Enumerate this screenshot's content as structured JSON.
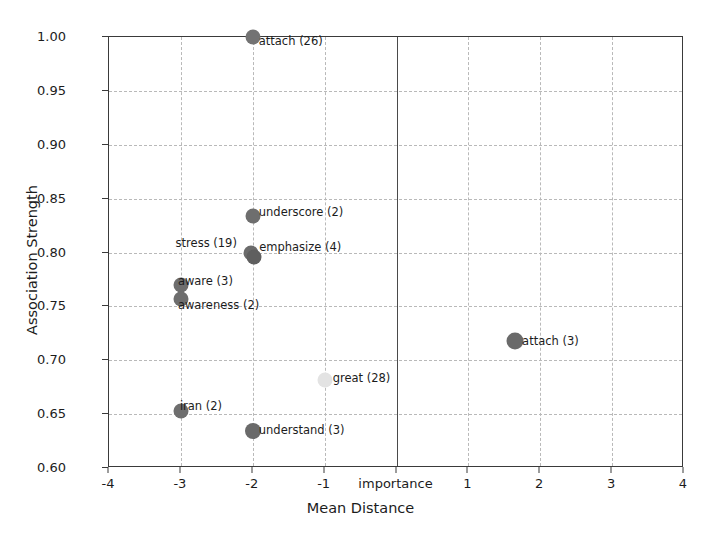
{
  "chart_data": {
    "type": "scatter",
    "title": "",
    "xlabel": "Mean Distance",
    "ylabel": "Association Strength",
    "xlim": [
      -4,
      4
    ],
    "ylim": [
      0.6,
      1.0
    ],
    "grid": true,
    "legend": "none",
    "xticks": [
      -4,
      -3,
      -2,
      -1,
      0,
      1,
      2,
      3,
      4
    ],
    "xtick_labels": [
      "-4",
      "-3",
      "-2",
      "-1",
      "importance",
      "1",
      "2",
      "3",
      "4"
    ],
    "yticks": [
      0.6,
      0.65,
      0.7,
      0.75,
      0.8,
      0.85,
      0.9,
      0.95,
      1.0
    ],
    "ytick_labels": [
      "0.60",
      "0.65",
      "0.70",
      "0.75",
      "0.80",
      "0.85",
      "0.90",
      "0.95",
      "1.00"
    ],
    "vline_x": 0,
    "points": [
      {
        "label": "attach (26)",
        "word": "attach",
        "count": 26,
        "x": -2.0,
        "y": 1.0,
        "size": 15,
        "color": "#737373"
      },
      {
        "label": "underscore (2)",
        "word": "underscore",
        "count": 2,
        "x": -2.0,
        "y": 0.834,
        "size": 15,
        "color": "#6e6e6e"
      },
      {
        "label": "stress (19)",
        "word": "stress",
        "count": 19,
        "x": -2.03,
        "y": 0.8,
        "size": 15,
        "color": "#6b6b6b"
      },
      {
        "label": "emphasize (4)",
        "word": "emphasize",
        "count": 4,
        "x": -1.98,
        "y": 0.796,
        "size": 15,
        "color": "#5f5f5f"
      },
      {
        "label": "aware (3)",
        "word": "aware",
        "count": 3,
        "x": -3.0,
        "y": 0.77,
        "size": 15,
        "color": "#6e6e6e"
      },
      {
        "label": "awareness (2)",
        "word": "awareness",
        "count": 2,
        "x": -3.0,
        "y": 0.757,
        "size": 15,
        "color": "#6e6e6e"
      },
      {
        "label": "attach (3)",
        "word": "attach",
        "count": 3,
        "x": 1.65,
        "y": 0.718,
        "size": 17,
        "color": "#6a6a6a"
      },
      {
        "label": "great (28)",
        "word": "great",
        "count": 28,
        "x": -1.0,
        "y": 0.682,
        "size": 15,
        "color": "#e3e3e3"
      },
      {
        "label": "iran (2)",
        "word": "iran",
        "count": 2,
        "x": -3.0,
        "y": 0.653,
        "size": 15,
        "color": "#6e6e6e"
      },
      {
        "label": "understand (3)",
        "word": "understand",
        "count": 3,
        "x": -2.0,
        "y": 0.634,
        "size": 16,
        "color": "#6a6a6a"
      }
    ]
  },
  "colors": {
    "axis": "#3a3a3a",
    "grid": "#b9b9b9",
    "text": "#1c1c1c",
    "background": "#ffffff",
    "zero_line": "#4a4a4a"
  }
}
